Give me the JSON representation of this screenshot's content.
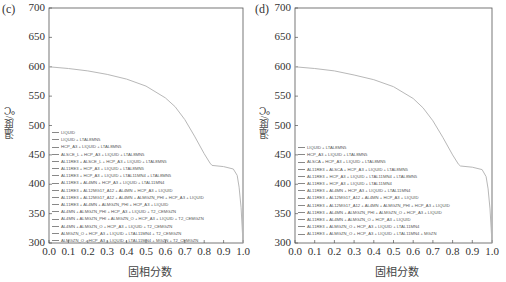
{
  "chart_data": [
    {
      "panel": "(c)",
      "type": "line",
      "title": "",
      "xlabel": "固相分数",
      "ylabel": "温度/℃",
      "xlim": [
        0.0,
        1.0
      ],
      "ylim": [
        300,
        700
      ],
      "xticks": [
        "0.0",
        "0.1",
        "0.2",
        "0.3",
        "0.4",
        "0.5",
        "0.6",
        "0.7",
        "0.8",
        "0.9",
        "1.0"
      ],
      "yticks": [
        "300",
        "350",
        "400",
        "450",
        "500",
        "550",
        "600",
        "650",
        "700"
      ],
      "grid": false,
      "legend_position": "lower left",
      "x": [
        0.0,
        0.1,
        0.2,
        0.3,
        0.4,
        0.5,
        0.6,
        0.65,
        0.7,
        0.75,
        0.8,
        0.83,
        0.84,
        0.9,
        0.95,
        0.97,
        0.98,
        0.99,
        1.0
      ],
      "y": [
        600,
        597,
        593,
        587,
        579,
        567,
        547,
        532,
        510,
        482,
        452,
        436,
        432,
        430,
        426,
        415,
        395,
        360,
        300
      ],
      "legend": [
        "LIQUID",
        "LIQUID + LTAL8MN5",
        "HCP_A3 + LIQUID + LTAL8MN5",
        "ALSCE_L + HCP_A3 + LIQUID + LTAL8MN5",
        "AL11RE3 + ALSCE_L + HCP_A3 + LIQUID + LTAL8MN5",
        "AL11RE3 + HCP_A3 + LIQUID + LTAL8MN5",
        "AL11RE3 + HCP_A3 + LIQUID + LTAL11MN4 + LTAL8MN5",
        "AL11RE3 + AL4MN + HCP_A3 + LIQUID + LTAL11MN4",
        "AL11RE3 + AL12MG17_A12 + AL4MN + HCP_A3 + LIQUID",
        "AL11RE3 + AL12MG17_A12 + AL4MN + ALMGZN_PHI + HCP_A3 + LIQUID",
        "AL11RE3 + AL4MN + ALMGZN_PHI + HCP_A3 + LIQUID",
        "AL4MN + ALMGZN_PHI + HCP_A3 + LIQUID + T2_CEMGZN",
        "AL4MN + ALMGZN_PHI + ALMGZN_O + HCP_A3 + LIQUID + T2_CEMGZN",
        "AL4MN + ALMGZN_O + HCP_A3 + LIQUID + T2_CEMGZN",
        "ALMGZN_O + HCP_A3 + LIQUID + LTAL11MN4 + T2_CEMGZN",
        "ALMGZN_O + HCP_A3 + LIQUID + LTAL11MN4 + MGZN + T2_CEMGZN"
      ]
    },
    {
      "panel": "(d)",
      "type": "line",
      "title": "",
      "xlabel": "固相分数",
      "ylabel": "温度/℃",
      "xlim": [
        0.0,
        1.0
      ],
      "ylim": [
        300,
        700
      ],
      "xticks": [
        "0.0",
        "0.1",
        "0.2",
        "0.3",
        "0.4",
        "0.5",
        "0.6",
        "0.7",
        "0.8",
        "0.9",
        "1.0"
      ],
      "yticks": [
        "300",
        "350",
        "400",
        "450",
        "500",
        "550",
        "600",
        "650",
        "700"
      ],
      "grid": false,
      "legend_position": "lower left",
      "x": [
        0.0,
        0.1,
        0.2,
        0.3,
        0.4,
        0.5,
        0.6,
        0.65,
        0.7,
        0.75,
        0.8,
        0.83,
        0.84,
        0.9,
        0.95,
        0.97,
        0.98,
        0.99,
        1.0
      ],
      "y": [
        600,
        597,
        593,
        586,
        578,
        566,
        546,
        530,
        508,
        480,
        450,
        434,
        431,
        429,
        425,
        413,
        392,
        358,
        300
      ],
      "legend": [
        "LIQUID + LTAL8MN5",
        "HCP_A3 + LIQUID + LTAL8MN5",
        "ALSCA + HCP_A3 + LIQUID + LTAL8MN5",
        "AL11RE3 + ALSCA + HCP_A3 + LIQUID + LTAL8MN5",
        "AL11RE3 + HCP_A3 + LIQUID + LTAL11MN4 + LTAL8MN5",
        "AL11RE3 + HCP_A3 + LIQUID + LTAL11MN4",
        "AL11RE3 + AL4MN + HCP_A3 + LIQUID + LTAL11MN4",
        "AL11RE3 + AL12MG17_A12 + AL4MN + HCP_A3 + LIQUID",
        "AL11RE3 + AL12MG17_A12 + AL4MN + ALMGZN_PHI + HCP_A3 + LIQUID",
        "AL11RE3 + AL4MN + ALMGZN_PHI + ALMGZN_O + HCP_A3 + LIQUID",
        "AL11RE3 + AL4MN + ALMGZN_O + HCP_A3 + LIQUID",
        "AL11RE3 + ALMGZN_O + HCP_A3 + LIQUID + LTAL11MN4",
        "AL11RE3 + ALMGZN_O + HCP_A3 + LIQUID + LTAL11MN4 + MGZN"
      ]
    }
  ],
  "colors": {
    "curve": "#b8b8b8",
    "axis": "#555555",
    "text": "#333333"
  }
}
